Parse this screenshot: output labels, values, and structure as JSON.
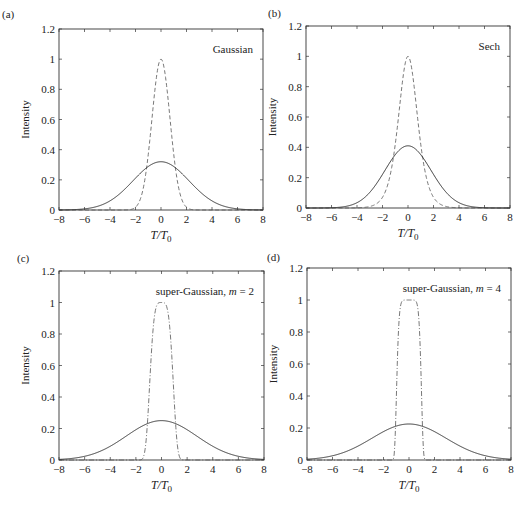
{
  "figure": {
    "panels": [
      {
        "id": "a",
        "label": "(a)",
        "title": "Gaussian",
        "title_italic_part": "",
        "title_suffix": ""
      },
      {
        "id": "b",
        "label": "(b)",
        "title": "Sech",
        "title_italic_part": "",
        "title_suffix": ""
      },
      {
        "id": "c",
        "label": "(c)",
        "title": "super-Gaussian, ",
        "title_italic_part": "m",
        "title_suffix": " = 2"
      },
      {
        "id": "d",
        "label": "(d)",
        "title": "super-Gaussian, ",
        "title_italic_part": "m",
        "title_suffix": " = 4"
      }
    ],
    "xlabel": "T/T0",
    "ylabel": "Intensity",
    "colors": {
      "axis": "#333333",
      "solid": "#333333",
      "dashed": "#555555",
      "background": "#ffffff"
    }
  },
  "chart_data": [
    {
      "type": "line",
      "panel": "(a)",
      "title": "Gaussian",
      "xlabel": "T/T0",
      "ylabel": "Intensity",
      "xlim": [
        -8,
        8
      ],
      "ylim": [
        0,
        1.2
      ],
      "xticks": [
        -8,
        -6,
        -4,
        -2,
        0,
        2,
        4,
        6,
        8
      ],
      "yticks": [
        0,
        0.2,
        0.4,
        0.6,
        0.8,
        1,
        1.2
      ],
      "ytick_labels": [
        "0",
        "0.2",
        "0.4",
        "0.6",
        "0.8",
        "1",
        "1.2"
      ],
      "grid": false,
      "series": [
        {
          "name": "input pulse",
          "style": "dashed",
          "shape": "gaussian",
          "peak": 1.0,
          "width": 1.0,
          "order": 1
        },
        {
          "name": "broadened pulse",
          "style": "solid",
          "shape": "gaussian",
          "peak": 0.32,
          "width": 3.1,
          "order": 1
        }
      ]
    },
    {
      "type": "line",
      "panel": "(b)",
      "title": "Sech",
      "xlabel": "T/T0",
      "ylabel": "Intensity",
      "xlim": [
        -8,
        8
      ],
      "ylim": [
        0,
        1.2
      ],
      "xticks": [
        -8,
        -6,
        -4,
        -2,
        0,
        2,
        4,
        6,
        8
      ],
      "yticks": [
        0,
        0.2,
        0.4,
        0.6,
        0.8,
        1,
        1.2
      ],
      "ytick_labels": [
        "0",
        "0.2",
        "0.4",
        "0.6",
        "0.8",
        "1",
        "1.2"
      ],
      "grid": false,
      "series": [
        {
          "name": "input pulse",
          "style": "dashed",
          "shape": "sech",
          "peak": 1.0,
          "width": 1.0,
          "order": 1
        },
        {
          "name": "broadened pulse",
          "style": "solid",
          "shape": "gaussian",
          "peak": 0.41,
          "width": 2.55,
          "order": 1
        }
      ]
    },
    {
      "type": "line",
      "panel": "(c)",
      "title": "super-Gaussian, m = 2",
      "xlabel": "T/T0",
      "ylabel": "Intensity",
      "xlim": [
        -8,
        8
      ],
      "ylim": [
        0,
        1.2
      ],
      "xticks": [
        -8,
        -6,
        -4,
        -2,
        0,
        2,
        4,
        6,
        8
      ],
      "yticks": [
        0,
        0.2,
        0.4,
        0.6,
        0.8,
        1,
        1.2
      ],
      "ytick_labels": [
        "0",
        "0.2",
        "0.4",
        "0.6",
        "0.8",
        "1",
        "1.2"
      ],
      "grid": false,
      "series": [
        {
          "name": "input pulse",
          "style": "dashdot",
          "shape": "supergaussian",
          "peak": 1.0,
          "width": 1.0,
          "order": 2
        },
        {
          "name": "broadened pulse",
          "style": "solid",
          "shape": "gaussian",
          "peak": 0.25,
          "width": 3.9,
          "order": 1
        }
      ]
    },
    {
      "type": "line",
      "panel": "(d)",
      "title": "super-Gaussian, m = 4",
      "xlabel": "T/T0",
      "ylabel": "Intensity",
      "xlim": [
        -8,
        8
      ],
      "ylim": [
        0,
        1.2
      ],
      "xticks": [
        -8,
        -6,
        -4,
        -2,
        0,
        2,
        4,
        6,
        8
      ],
      "yticks": [
        0,
        0.2,
        0.4,
        0.6,
        0.8,
        1,
        1.2
      ],
      "ytick_labels": [
        "0",
        "0.2",
        "0.4",
        "0.6",
        "0.8",
        "1",
        "1.2"
      ],
      "grid": false,
      "series": [
        {
          "name": "input pulse",
          "style": "dashdot",
          "shape": "supergaussian",
          "peak": 1.0,
          "width": 1.0,
          "order": 4
        },
        {
          "name": "broadened pulse",
          "style": "solid",
          "shape": "gaussian",
          "peak": 0.225,
          "width": 4.1,
          "order": 1
        }
      ]
    }
  ]
}
